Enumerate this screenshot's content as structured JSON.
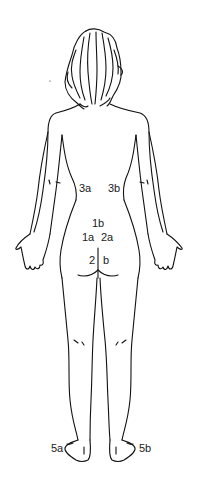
{
  "diagram": {
    "line_color": "#111111",
    "labels": [
      {
        "id": "3a",
        "text": "3a",
        "x": 79,
        "y": 183
      },
      {
        "id": "3b",
        "text": "3b",
        "x": 108,
        "y": 183
      },
      {
        "id": "1b",
        "text": "1b",
        "x": 92,
        "y": 218
      },
      {
        "id": "1a",
        "text": "1a",
        "x": 82,
        "y": 232
      },
      {
        "id": "2a",
        "text": "2a",
        "x": 101,
        "y": 232
      },
      {
        "id": "2",
        "text": "2",
        "x": 89,
        "y": 255
      },
      {
        "id": "b",
        "text": "b",
        "x": 103,
        "y": 255
      },
      {
        "id": "5a",
        "text": "5a",
        "x": 51,
        "y": 443
      },
      {
        "id": "5b",
        "text": "5b",
        "x": 139,
        "y": 443
      }
    ]
  }
}
